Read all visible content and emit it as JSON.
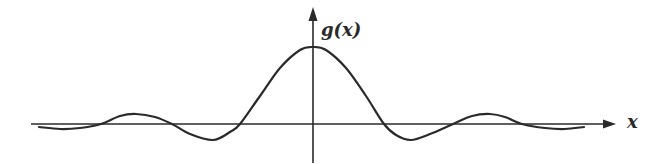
{
  "chart_data": {
    "type": "line",
    "title": "",
    "xlabel": "x",
    "ylabel": "g(x)",
    "function_shape": "damped oscillation (sinc-like), symmetric about the vertical axis",
    "grid": false,
    "legend": null,
    "axis_ticks": "none",
    "key_points_px": {
      "peak": [
        313,
        47
      ],
      "zero_crossings": [
        101,
        172,
        240,
        384,
        453,
        522
      ],
      "minima": [
        [
          213,
          140
        ],
        [
          411,
          140
        ]
      ],
      "secondary_maxima": [
        [
          136,
          114
        ],
        [
          490,
          114
        ]
      ],
      "endpoints": [
        [
          39,
          127
        ],
        [
          584,
          127
        ]
      ]
    },
    "series": [
      {
        "name": "g(x)",
        "x": [
          39,
          60,
          80,
          101,
          120,
          136,
          155,
          172,
          190,
          213,
          230,
          240,
          260,
          280,
          300,
          313,
          326,
          346,
          366,
          384,
          396,
          411,
          430,
          453,
          472,
          490,
          505,
          522,
          545,
          565,
          584
        ],
        "y": [
          127,
          129,
          128,
          124,
          116,
          114,
          117,
          124,
          134,
          140,
          132,
          124,
          96,
          68,
          50,
          47,
          50,
          68,
          96,
          124,
          135,
          140,
          134,
          124,
          116,
          114,
          117,
          124,
          128,
          129,
          127
        ]
      }
    ]
  },
  "labels": {
    "y_axis": "g(x)",
    "x_axis": "x"
  },
  "colors": {
    "ink": "#2a2a2a",
    "background": "#ffffff"
  }
}
